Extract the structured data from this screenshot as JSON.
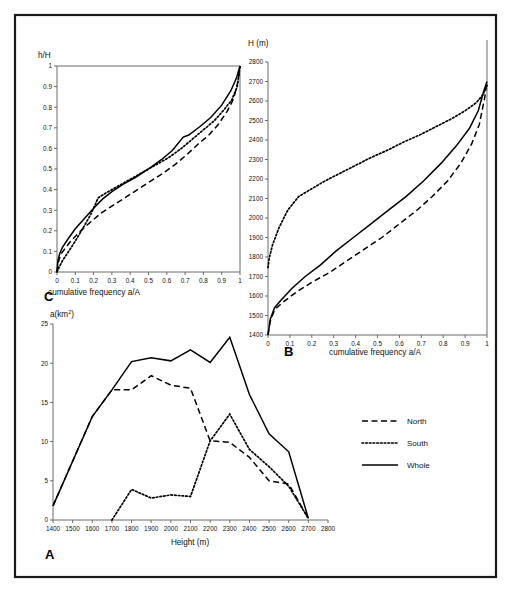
{
  "figure": {
    "panels": [
      "A",
      "B",
      "C"
    ],
    "border_color": "#1a1a1a",
    "axis_color": "#6b6b6b",
    "line_color": "#000000"
  },
  "legend": {
    "position": "right-middle",
    "items": [
      {
        "label": "North",
        "style": "dashed"
      },
      {
        "label": "South",
        "style": "dotted"
      },
      {
        "label": "Whole",
        "style": "solid"
      }
    ]
  },
  "labels": {
    "panel_a": "A",
    "panel_b": "B",
    "panel_c": "C",
    "a_km2_prefix": "a(km",
    "a_km2_sup": "2",
    "a_km2_suffix": ")",
    "height_m": "Height (m)",
    "h_over_H": "h/H",
    "H_m": "H (m)",
    "cumfreq": "cumulative frequency a/A"
  },
  "chart_data": [
    {
      "id": "panel_a",
      "type": "line",
      "title": "",
      "panel_letter": "A",
      "xlabel": "Height (m)",
      "ylabel": "a(km2)",
      "xlim": [
        1400,
        2800
      ],
      "ylim": [
        0,
        25
      ],
      "xticks": [
        1400,
        1500,
        1600,
        1700,
        1800,
        1900,
        2000,
        2100,
        2200,
        2300,
        2400,
        2500,
        2600,
        2700,
        2800
      ],
      "yticks": [
        0,
        5,
        10,
        15,
        20,
        25
      ],
      "grid": false,
      "legend": [
        "North",
        "South",
        "Whole"
      ],
      "x": [
        1400,
        1500,
        1600,
        1700,
        1800,
        1900,
        2000,
        2100,
        2200,
        2300,
        2400,
        2500,
        2600,
        2700
      ],
      "series": [
        {
          "name": "Whole",
          "style": "solid",
          "values": [
            1.8,
            7.5,
            13.2,
            16.6,
            20.2,
            20.7,
            20.3,
            21.7,
            20.1,
            23.3,
            16.0,
            11.0,
            8.7,
            0.2
          ]
        },
        {
          "name": "North",
          "style": "dashed",
          "values": [
            1.8,
            7.5,
            13.2,
            16.6,
            16.6,
            18.4,
            17.2,
            16.8,
            10.1,
            9.9,
            8.0,
            5.0,
            4.6,
            0.2
          ]
        },
        {
          "name": "South",
          "style": "dotted",
          "values": [
            null,
            null,
            null,
            0.0,
            3.9,
            2.8,
            3.2,
            3.0,
            10.1,
            13.5,
            9.0,
            6.8,
            4.3,
            0.2
          ]
        }
      ]
    },
    {
      "id": "panel_b",
      "type": "line",
      "title": "",
      "panel_letter": "B",
      "xlabel": "cumulative frequency a/A",
      "ylabel": "H (m)",
      "xlim": [
        0,
        1.0
      ],
      "ylim": [
        1400,
        2800
      ],
      "xticks": [
        0,
        0.1,
        0.2,
        0.3,
        0.4,
        0.5,
        0.6,
        0.7,
        0.8,
        0.9,
        1.0
      ],
      "yticks": [
        1400,
        1500,
        1600,
        1700,
        1800,
        1900,
        2000,
        2100,
        2200,
        2300,
        2400,
        2500,
        2600,
        2700,
        2800
      ],
      "grid": false,
      "legend": [
        "North",
        "South",
        "Whole"
      ],
      "series": [
        {
          "name": "Whole",
          "style": "solid",
          "x": [
            0.0,
            0.01,
            0.03,
            0.06,
            0.11,
            0.17,
            0.24,
            0.31,
            0.39,
            0.47,
            0.55,
            0.63,
            0.71,
            0.79,
            0.86,
            0.92,
            0.96,
            0.985,
            1.0
          ],
          "y": [
            1400,
            1480,
            1540,
            1580,
            1640,
            1700,
            1760,
            1830,
            1900,
            1970,
            2040,
            2110,
            2190,
            2280,
            2370,
            2460,
            2550,
            2650,
            2700
          ]
        },
        {
          "name": "North",
          "style": "dashed",
          "x": [
            0.0,
            0.01,
            0.03,
            0.07,
            0.13,
            0.2,
            0.28,
            0.36,
            0.44,
            0.52,
            0.6,
            0.68,
            0.75,
            0.82,
            0.88,
            0.93,
            0.965,
            0.99,
            1.0
          ],
          "y": [
            1400,
            1470,
            1530,
            1570,
            1620,
            1670,
            1720,
            1780,
            1840,
            1900,
            1970,
            2040,
            2110,
            2190,
            2280,
            2380,
            2480,
            2620,
            2700
          ]
        },
        {
          "name": "South",
          "style": "dotted",
          "x": [
            0.0,
            0.005,
            0.02,
            0.05,
            0.09,
            0.14,
            0.2,
            0.26,
            0.33,
            0.4,
            0.47,
            0.55,
            0.62,
            0.7,
            0.77,
            0.84,
            0.9,
            0.95,
            0.98,
            1.0
          ],
          "y": [
            1745,
            1790,
            1860,
            1950,
            2040,
            2110,
            2150,
            2190,
            2230,
            2270,
            2310,
            2350,
            2390,
            2430,
            2470,
            2510,
            2550,
            2590,
            2630,
            2680
          ]
        }
      ]
    },
    {
      "id": "panel_c",
      "type": "line",
      "title": "",
      "panel_letter": "C",
      "xlabel": "cumulative frequency a/A",
      "ylabel": "h/H",
      "xlim": [
        0,
        1.0
      ],
      "ylim": [
        0,
        1.0
      ],
      "xticks": [
        0,
        0.1,
        0.2,
        0.3,
        0.4,
        0.5,
        0.6,
        0.7,
        0.8,
        0.9,
        1.0
      ],
      "yticks": [
        0,
        0.1,
        0.2,
        0.3,
        0.4,
        0.5,
        0.6,
        0.7,
        0.8,
        0.9,
        1.0
      ],
      "grid": false,
      "legend": [
        "North",
        "South",
        "Whole"
      ],
      "series": [
        {
          "name": "Whole",
          "style": "solid",
          "x": [
            0.0,
            0.005,
            0.015,
            0.03,
            0.06,
            0.1,
            0.15,
            0.2,
            0.25,
            0.3,
            0.36,
            0.43,
            0.5,
            0.57,
            0.63,
            0.69,
            0.72,
            0.78,
            0.84,
            0.9,
            0.95,
            0.98,
            1.0
          ],
          "y": [
            0.0,
            0.055,
            0.09,
            0.12,
            0.16,
            0.21,
            0.26,
            0.31,
            0.355,
            0.39,
            0.425,
            0.46,
            0.5,
            0.545,
            0.59,
            0.655,
            0.665,
            0.705,
            0.75,
            0.81,
            0.88,
            0.94,
            1.0
          ]
        },
        {
          "name": "North",
          "style": "dashed",
          "x": [
            0.0,
            0.008,
            0.02,
            0.045,
            0.08,
            0.13,
            0.18,
            0.24,
            0.3,
            0.37,
            0.44,
            0.51,
            0.58,
            0.65,
            0.71,
            0.77,
            0.83,
            0.88,
            0.93,
            0.965,
            0.99,
            1.0
          ],
          "y": [
            0.0,
            0.05,
            0.085,
            0.115,
            0.155,
            0.2,
            0.24,
            0.285,
            0.32,
            0.36,
            0.4,
            0.44,
            0.48,
            0.525,
            0.57,
            0.62,
            0.665,
            0.715,
            0.78,
            0.84,
            0.93,
            1.0
          ]
        },
        {
          "name": "South",
          "style": "dotted",
          "x": [
            0.0,
            0.01,
            0.03,
            0.06,
            0.1,
            0.14,
            0.185,
            0.225,
            0.27,
            0.33,
            0.4,
            0.47,
            0.54,
            0.61,
            0.68,
            0.74,
            0.8,
            0.86,
            0.91,
            0.955,
            0.985,
            1.0
          ],
          "y": [
            0.0,
            0.02,
            0.055,
            0.095,
            0.15,
            0.21,
            0.28,
            0.36,
            0.385,
            0.415,
            0.45,
            0.485,
            0.52,
            0.555,
            0.6,
            0.645,
            0.69,
            0.735,
            0.785,
            0.835,
            0.9,
            1.0
          ]
        }
      ]
    }
  ]
}
